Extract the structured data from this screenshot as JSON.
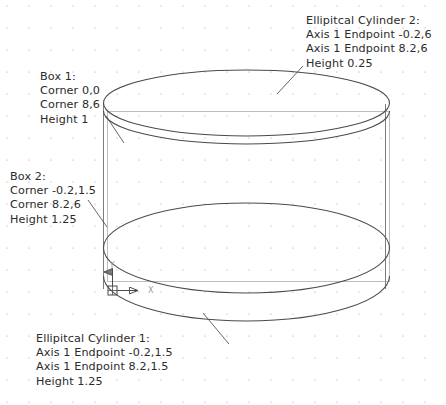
{
  "drawing": {
    "type": "cad-wireframe",
    "background_color": "#ffffff",
    "grid": {
      "visible": true,
      "dot_color": "#d9d4dd",
      "spacing_px": 22
    },
    "colors": {
      "box1_stroke": "#b9b9b9",
      "box2_stroke": "#6d6d6d",
      "ellipse_stroke": "#4a4a4a",
      "leader_stroke": "#555555",
      "text": "#2b2b2b",
      "ucs_stroke": "#4a4a4a"
    }
  },
  "labels": {
    "cylinder2": {
      "title": "Ellipitcal Cylinder 2:",
      "line1": "Axis 1 Endpoint -0.2,6",
      "line2": "Axis 1 Endpoint 8.2,6",
      "line3": "Height 0.25"
    },
    "box1": {
      "title": "Box 1:",
      "line1": "Corner 0,0",
      "line2": "Corner 8,6",
      "line3": "Height 1"
    },
    "box2": {
      "title": "Box 2:",
      "line1": "Corner -0.2,1.5",
      "line2": "Corner 8.2,6",
      "line3": "Height 1.25"
    },
    "cylinder1": {
      "title": "Ellipitcal Cylinder 1:",
      "line1": "Axis 1 Endpoint -0.2,1.5",
      "line2": "Axis 1 Endpoint 8.2,1.5",
      "line3": "Height 1.25"
    }
  },
  "ucs_icon": {
    "x_axis_label": "X",
    "y_axis_label": "Y"
  }
}
